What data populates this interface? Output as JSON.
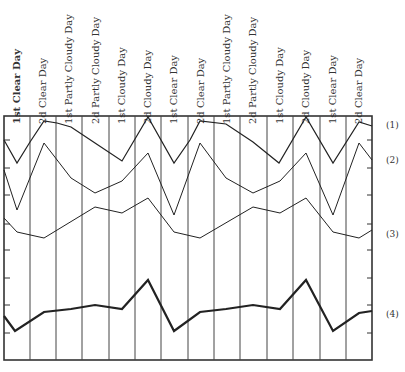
{
  "chart_data": {
    "type": "line",
    "title": "",
    "xlabel": "",
    "ylabel": "",
    "grid": "vertical lines between day columns; tick marks on left and right axes",
    "legend": "series numbered (1)-(4) at right edge",
    "categories": [
      "1st Clear Day",
      "2d Clear Day",
      "1st Partly Cloudy Day",
      "2d Partly Cloudy Day",
      "1st Cloudy Day",
      "2d Cloudy Day",
      "1st Clear Day",
      "2d Clear Day",
      "1st Partly Cloudy Day",
      "2d Partly Cloudy Day",
      "1st Cloudy Day",
      "2d Cloudy Day",
      "1st Clear Day",
      "2d Clear Day"
    ],
    "series": [
      {
        "name": "(1)",
        "stroke_width": 1.2,
        "points": [
          [
            4,
            140
          ],
          [
            17,
            163
          ],
          [
            30,
            142
          ],
          [
            44,
            121
          ],
          [
            57,
            123
          ],
          [
            71,
            127
          ],
          [
            95,
            143
          ],
          [
            122,
            161
          ],
          [
            148,
            117
          ],
          [
            174,
            163
          ],
          [
            190,
            140
          ],
          [
            200,
            121
          ],
          [
            226,
            124
          ],
          [
            253,
            142
          ],
          [
            279,
            163
          ],
          [
            306,
            117
          ],
          [
            333,
            163
          ],
          [
            359,
            122
          ],
          [
            372,
            126
          ]
        ]
      },
      {
        "name": "(2)",
        "stroke_width": 1.0,
        "points": [
          [
            4,
            170
          ],
          [
            17,
            210
          ],
          [
            44,
            143
          ],
          [
            71,
            178
          ],
          [
            95,
            193
          ],
          [
            122,
            181
          ],
          [
            148,
            153
          ],
          [
            174,
            215
          ],
          [
            200,
            143
          ],
          [
            226,
            178
          ],
          [
            253,
            193
          ],
          [
            280,
            181
          ],
          [
            306,
            153
          ],
          [
            333,
            215
          ],
          [
            359,
            143
          ],
          [
            372,
            160
          ]
        ]
      },
      {
        "name": "(3)",
        "stroke_width": 1.0,
        "points": [
          [
            4,
            218
          ],
          [
            17,
            232
          ],
          [
            44,
            238
          ],
          [
            95,
            207
          ],
          [
            122,
            213
          ],
          [
            148,
            198
          ],
          [
            174,
            232
          ],
          [
            200,
            238
          ],
          [
            253,
            207
          ],
          [
            280,
            213
          ],
          [
            306,
            198
          ],
          [
            333,
            232
          ],
          [
            359,
            238
          ],
          [
            372,
            230
          ]
        ]
      },
      {
        "name": "(4)",
        "stroke_width": 2.2,
        "points": [
          [
            4,
            316
          ],
          [
            15,
            331
          ],
          [
            44,
            312
          ],
          [
            71,
            309
          ],
          [
            95,
            305
          ],
          [
            122,
            309
          ],
          [
            148,
            280
          ],
          [
            174,
            331
          ],
          [
            200,
            312
          ],
          [
            226,
            309
          ],
          [
            253,
            305
          ],
          [
            280,
            309
          ],
          [
            306,
            280
          ],
          [
            333,
            331
          ],
          [
            359,
            313
          ],
          [
            372,
            311
          ]
        ]
      }
    ],
    "series_label_positions": [
      {
        "label": "(1)",
        "x": 386,
        "y": 126
      },
      {
        "label": "(2)",
        "x": 386,
        "y": 161
      },
      {
        "label": "(3)",
        "x": 386,
        "y": 235
      },
      {
        "label": "(4)",
        "x": 386,
        "y": 315
      }
    ],
    "frame": {
      "left": 4,
      "top": 116,
      "right": 372,
      "bottom": 360
    },
    "vertical_lines_x": [
      30,
      56,
      82,
      109,
      135,
      161,
      188,
      214,
      240,
      267,
      293,
      320,
      346
    ],
    "label_x": [
      17,
      43,
      69,
      96,
      122,
      148,
      174,
      201,
      227,
      253,
      280,
      306,
      333,
      359
    ],
    "bold_labels": [
      0
    ],
    "tick_y": [
      140,
      168,
      195,
      224,
      250,
      278,
      305,
      333
    ]
  }
}
